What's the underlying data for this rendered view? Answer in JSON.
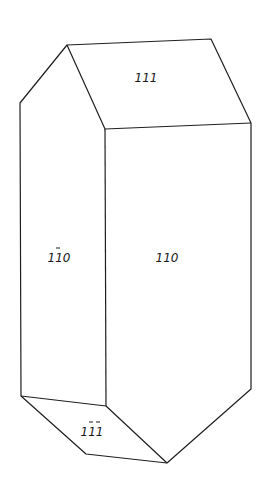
{
  "diagram": {
    "type": "crystal-habit",
    "faces": [
      {
        "id": "top",
        "label": "111",
        "overbars": []
      },
      {
        "id": "left-prism",
        "label": "1̄10",
        "overbars": [
          0
        ]
      },
      {
        "id": "front-prism",
        "label": "110",
        "overbars": []
      },
      {
        "id": "bottom",
        "label": "1̄1̄1̄",
        "overbars": [
          1,
          2
        ]
      }
    ],
    "labels": {
      "top": "111",
      "left_prism_digits": "110",
      "front_prism": "110",
      "bottom_digits": "111"
    },
    "line_color": "#1f1f1f"
  }
}
